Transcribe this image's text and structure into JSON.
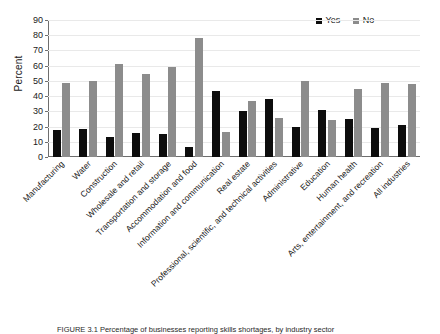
{
  "figure": {
    "caption": "FIGURE 3.1  Percentage of businesses reporting skills shortages, by industry sector"
  },
  "chart_data": {
    "type": "bar",
    "title": "",
    "xlabel": "",
    "ylabel": "Percent",
    "ylim": [
      0,
      90
    ],
    "ytick_step": 10,
    "yticks": [
      0,
      10,
      20,
      30,
      40,
      50,
      60,
      70,
      80,
      90
    ],
    "grid": true,
    "legend_position": "top-right",
    "categories": [
      "Manufacturing",
      "Water",
      "Construction",
      "Wholesale and retail",
      "Transportation and storage",
      "Accommodation and food",
      "Information and communication",
      "Real estate",
      "Professional, scientific, and technical activities",
      "Administrative",
      "Education",
      "Human health",
      "Arts, entertainment, and recreation",
      "All industries"
    ],
    "series": [
      {
        "name": "Yes",
        "color": "#0d0d0d",
        "values": [
          17.5,
          18.7,
          13.4,
          15.8,
          15.0,
          6.6,
          43.1,
          30.2,
          38.0,
          19.9,
          31.2,
          25.0,
          18.8,
          21.3
        ]
      },
      {
        "name": "No",
        "color": "#8c8c8c",
        "values": [
          48.4,
          49.8,
          61.0,
          54.4,
          59.0,
          78.2,
          16.4,
          37.0,
          25.7,
          49.8,
          24.5,
          44.9,
          48.4,
          47.8
        ]
      }
    ]
  }
}
